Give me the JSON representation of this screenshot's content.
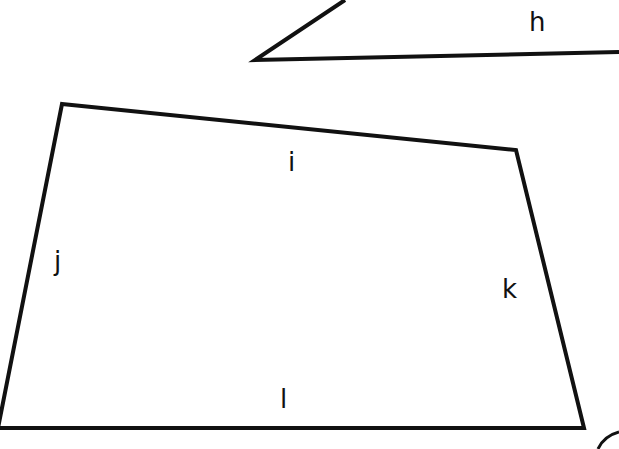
{
  "diagram": {
    "shapes": [
      {
        "id": "triangle",
        "type": "polygon",
        "partial": true,
        "points": [
          [
            345,
            0
          ],
          [
            255,
            60
          ],
          [
            619,
            52
          ]
        ],
        "side_labels": [
          {
            "text": "h",
            "x": 537,
            "y": 30
          }
        ]
      },
      {
        "id": "quadrilateral",
        "type": "polygon",
        "points": [
          [
            62,
            104
          ],
          [
            516,
            150
          ],
          [
            584,
            428
          ],
          [
            0,
            428
          ]
        ],
        "side_labels": [
          {
            "text": "i",
            "x": 294,
            "y": 169
          },
          {
            "text": "j",
            "x": 60,
            "y": 268
          },
          {
            "text": "k",
            "x": 511,
            "y": 296
          },
          {
            "text": "l",
            "x": 285,
            "y": 407
          }
        ]
      }
    ],
    "stroke_color": "#111111",
    "background": "#ffffff"
  },
  "labels": {
    "h": "h",
    "i": "i",
    "j": "j",
    "k": "k",
    "l": "l"
  }
}
